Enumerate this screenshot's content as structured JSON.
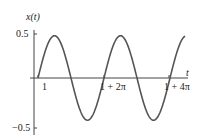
{
  "chart_data": {
    "type": "line",
    "title": "",
    "xlabel": "t",
    "ylabel": "x(t)",
    "function": "x(t) = 0.48 sin(t - 1), t >= 1",
    "y_ticks": [
      {
        "value": 0.5,
        "label": "0.5"
      },
      {
        "value": -0.5,
        "label": "−0.5"
      }
    ],
    "x_ticks": [
      {
        "value": 1,
        "label": "1"
      },
      {
        "value": 7.283,
        "label": "1 + 2π"
      },
      {
        "value": 13.566,
        "label": "1 + 4π"
      }
    ],
    "xlim": [
      0.6,
      15.0
    ],
    "ylim": [
      -0.5,
      0.5
    ],
    "grid": false,
    "legend": null,
    "series": [
      {
        "name": "x(t)",
        "amplitude": 0.48,
        "start_t": 1,
        "end_t": 15.0,
        "color": "#555555",
        "x": [
          1,
          2.571,
          4.142,
          5.712,
          7.283,
          8.854,
          10.425,
          11.995,
          13.566,
          15.0
        ],
        "values": [
          0,
          0.48,
          0,
          -0.48,
          0,
          0.48,
          0,
          -0.48,
          0,
          0.475
        ]
      }
    ]
  },
  "labels": {
    "ylabel": "x(t)",
    "xlabel": "t",
    "ytick_top": "0.5",
    "ytick_bottom": "−0.5",
    "xtick_1": "1",
    "xtick_2": "1 + 2π",
    "xtick_3": "1 + 4π"
  }
}
